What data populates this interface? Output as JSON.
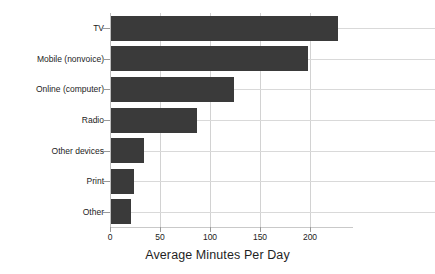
{
  "chart_data": {
    "type": "bar",
    "orientation": "horizontal",
    "title": "",
    "xlabel": "Average Minutes Per Day",
    "ylabel": "",
    "categories": [
      "TV",
      "Mobile (nonvoice)",
      "Online (computer)",
      "Radio",
      "Other devices",
      "Print",
      "Other"
    ],
    "values": [
      228,
      198,
      124,
      87,
      34,
      24,
      21
    ],
    "xlim": [
      0,
      243
    ],
    "xticks": [
      0,
      50,
      100,
      150,
      200
    ],
    "xtick_labels": [
      "0",
      "50",
      "100",
      "150",
      "200"
    ],
    "grid": true,
    "grid_axis": "both",
    "legend": "none",
    "bar_color": "#3a3a3a",
    "grid_color": "#d5d5d5",
    "axis_color": "#bdbdbd",
    "background": "#ffffff"
  }
}
